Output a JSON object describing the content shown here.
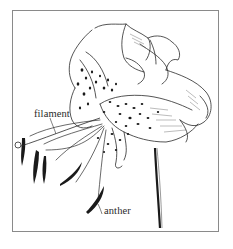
{
  "figure": {
    "labels": {
      "filament": "filament",
      "anther": "anther"
    },
    "colors": {
      "ink": "#1e1e1e",
      "frame": "#8a8a8a",
      "background": "#ffffff"
    }
  }
}
